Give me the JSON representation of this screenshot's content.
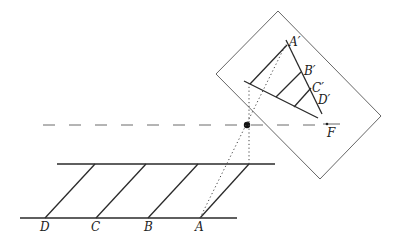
{
  "figure": {
    "ground_points": [
      {
        "id": "D",
        "label": "D"
      },
      {
        "id": "C",
        "label": "C"
      },
      {
        "id": "B",
        "label": "B"
      },
      {
        "id": "A",
        "label": "A"
      }
    ],
    "image_points": [
      {
        "id": "A'",
        "label": "A′"
      },
      {
        "id": "B'",
        "label": "B′"
      },
      {
        "id": "C'",
        "label": "C′"
      },
      {
        "id": "D'",
        "label": "D′"
      }
    ],
    "focal_point": {
      "label": "F"
    },
    "colors": {
      "line": "#2a2a2a",
      "frame": "#555555",
      "axis": "#6a6a6a",
      "background": "#ffffff"
    }
  }
}
